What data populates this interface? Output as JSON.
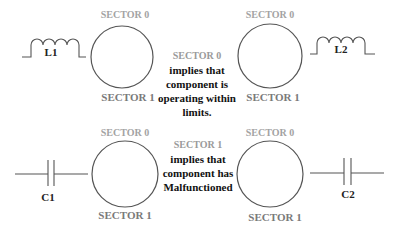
{
  "diagram": {
    "colors": {
      "background": "#ffffff",
      "stroke": "#555555",
      "sector0_label": "#a3a3a3",
      "sector1_label": "#7a7a7a",
      "note_text": "#111111"
    },
    "circles": [
      {
        "id": "circle-top-left",
        "top_label": "SECTOR 0",
        "bottom_label": "SECTOR 1"
      },
      {
        "id": "circle-top-right",
        "top_label": "SECTOR 0",
        "bottom_label": "SECTOR 1"
      },
      {
        "id": "circle-bottom-left",
        "top_label": "SECTOR 0",
        "bottom_label": "SECTOR 1"
      },
      {
        "id": "circle-bottom-right",
        "top_label": "SECTOR 0",
        "bottom_label": "SECTOR 1"
      }
    ],
    "components": {
      "inductor_left": "L1",
      "inductor_right": "L2",
      "capacitor_left": "C1",
      "capacitor_right": "C2"
    },
    "notes": [
      {
        "heading": "SECTOR 0",
        "lines": [
          "implies that",
          "component is",
          "operating within",
          "limits."
        ]
      },
      {
        "heading": "SECTOR 1",
        "lines": [
          "implies that",
          "component has",
          "Malfunctioned"
        ]
      }
    ]
  }
}
